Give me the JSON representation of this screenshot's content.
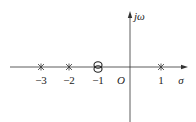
{
  "diagram": {
    "type": "pole-zero plot",
    "axes": {
      "real_label": "σ",
      "imag_label": "jω",
      "origin_label": "O"
    },
    "poles": [
      {
        "value": -3,
        "label": "−3",
        "marker": "asterisk"
      },
      {
        "value": -2,
        "label": "−2",
        "marker": "asterisk"
      },
      {
        "value": 1,
        "label": "1",
        "marker": "asterisk"
      }
    ],
    "zeros": [
      {
        "value": -1,
        "label": "−1",
        "marker": "double-circle",
        "multiplicity": 2
      }
    ],
    "colors": {
      "line": "#333333",
      "background": "#ffffff"
    }
  }
}
